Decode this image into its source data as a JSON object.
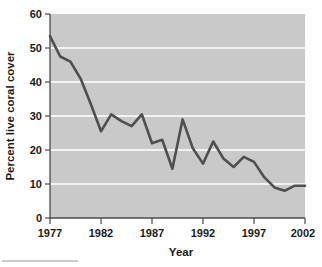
{
  "chart_data": {
    "type": "line",
    "title": "",
    "subtitle": "",
    "xlabel": "Year",
    "ylabel": "Percent live coral cover",
    "xlim": [
      1977,
      2002
    ],
    "ylim": [
      0,
      60
    ],
    "xticks": [
      1977,
      1982,
      1987,
      1992,
      1997,
      2002
    ],
    "yticks": [
      0,
      10,
      20,
      30,
      40,
      50,
      60
    ],
    "grid": "horizontal-white-gridlines",
    "legend": "none",
    "plot_background": "#c9c9c9",
    "line_color": "#4f4f4f",
    "x": [
      1977,
      1978,
      1979,
      1980,
      1981,
      1982,
      1983,
      1984,
      1985,
      1986,
      1987,
      1988,
      1989,
      1990,
      1991,
      1992,
      1993,
      1994,
      1995,
      1996,
      1997,
      1998,
      1999,
      2000,
      2001,
      2002
    ],
    "values": [
      53.5,
      47.5,
      46.0,
      41.0,
      33.5,
      25.5,
      30.5,
      28.5,
      27.0,
      30.5,
      22.0,
      23.0,
      14.5,
      29.0,
      20.5,
      16.0,
      22.5,
      17.5,
      15.0,
      18.0,
      16.5,
      12.0,
      9.0,
      8.0,
      9.5,
      9.5
    ],
    "series": [
      {
        "name": "Percent live coral cover",
        "values": [
          53.5,
          47.5,
          46.0,
          41.0,
          33.5,
          25.5,
          30.5,
          28.5,
          27.0,
          30.5,
          22.0,
          23.0,
          14.5,
          29.0,
          20.5,
          16.0,
          22.5,
          17.5,
          15.0,
          18.0,
          16.5,
          12.0,
          9.0,
          8.0,
          9.5,
          9.5
        ]
      }
    ],
    "xtick_labels": [
      "1977",
      "1982",
      "1987",
      "1992",
      "1997",
      "2002"
    ],
    "ytick_labels": [
      "0",
      "10",
      "20",
      "30",
      "40",
      "50",
      "60"
    ]
  },
  "axes": {
    "y_title": "Percent live coral cover",
    "x_title": "Year"
  }
}
